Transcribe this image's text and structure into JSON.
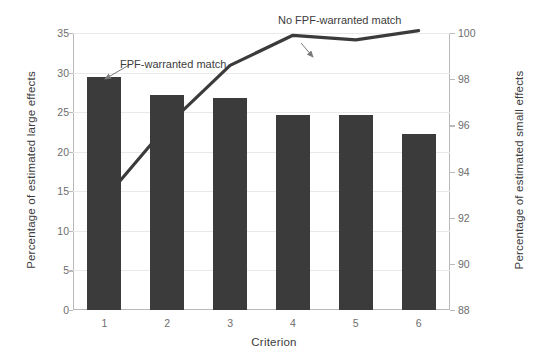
{
  "chart_data": {
    "type": "bar",
    "title": "",
    "xlabel": "Criterion",
    "ylabel": "Percentage of estimated large effects",
    "ylabel_right": "Percentage of estimated small effects",
    "categories": [
      "1",
      "2",
      "3",
      "4",
      "5",
      "6"
    ],
    "grid": true,
    "legend_position": "inline-annotations",
    "ylim": [
      0,
      35
    ],
    "ylim_right": [
      88,
      100
    ],
    "yticks": [
      0,
      5,
      10,
      15,
      20,
      25,
      30,
      35
    ],
    "yticks_right": [
      88,
      90,
      92,
      94,
      96,
      98,
      100
    ],
    "series": [
      {
        "name": "FPF-warranted match",
        "kind": "bar",
        "axis": "left",
        "color": "#3b3b3b",
        "values": [
          29.5,
          27.2,
          26.8,
          24.7,
          24.7,
          22.3
        ]
      },
      {
        "name": "No FPF-warranted match",
        "kind": "line",
        "axis": "right",
        "color": "#3b3b3b",
        "values": [
          92.8,
          96.0,
          98.6,
          99.9,
          99.7,
          100.1
        ]
      }
    ],
    "annotations": [
      {
        "text": "FPF-warranted match",
        "target": "bar-1"
      },
      {
        "text": "No FPF-warranted match",
        "target": "line-point-5"
      }
    ]
  },
  "axes": {
    "xlabel": "Criterion",
    "ylabel_left": "Percentage of estimated large effects",
    "ylabel_right": "Percentage of estimated small effects",
    "xtick_labels": [
      "1",
      "2",
      "3",
      "4",
      "5",
      "6"
    ],
    "ytick_labels_left": [
      "0",
      "5",
      "10",
      "15",
      "20",
      "25",
      "30",
      "35"
    ],
    "ytick_labels_right": [
      "88",
      "90",
      "92",
      "94",
      "96",
      "98",
      "100"
    ]
  },
  "annotations": {
    "bar_label": "FPF-warranted match",
    "line_label": "No FPF-warranted match"
  },
  "colors": {
    "bar": "#3b3b3b",
    "line": "#3b3b3b",
    "grid": "#e9e9e9",
    "axis": "#b9b9b9",
    "text": "#3c3c3c",
    "tick_text": "#6d6d6d",
    "background": "#ffffff"
  }
}
